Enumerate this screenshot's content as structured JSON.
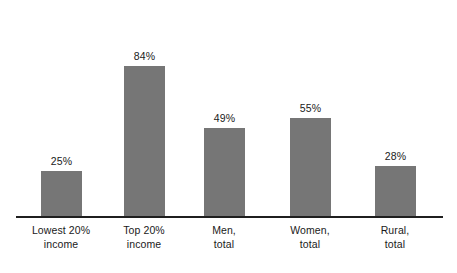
{
  "chart_data": {
    "type": "bar",
    "title": "",
    "subtitle": "",
    "xlabel": "",
    "ylabel": "",
    "ylim": [
      0,
      100
    ],
    "grid": false,
    "legend": false,
    "legend_position": "none",
    "value_suffix": "%",
    "categories": [
      "Lowest 20% income",
      "Top 20% income",
      "Men, total",
      "Women, total",
      "Rural, total"
    ],
    "category_lines": [
      [
        "Lowest 20%",
        "income"
      ],
      [
        "Top 20%",
        "income"
      ],
      [
        "Men,",
        "total"
      ],
      [
        "Women,",
        "total"
      ],
      [
        "Rural,",
        "total"
      ]
    ],
    "values": [
      25,
      84,
      49,
      55,
      28
    ],
    "value_labels": [
      "25%",
      "84%",
      "49%",
      "55%",
      "28%"
    ],
    "colors": {
      "bar": "#767676",
      "axis": "#1f1f1f",
      "text": "#1a1a1a",
      "background": "#ffffff"
    }
  }
}
